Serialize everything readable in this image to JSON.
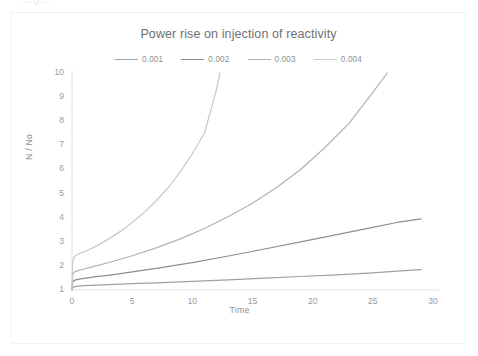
{
  "top_crop_text": "…g…",
  "chart_data": {
    "type": "line",
    "title": "Power rise on injection of reactivity",
    "xlabel": "Time",
    "ylabel": "N / No",
    "xlim": [
      0,
      30
    ],
    "ylim": [
      1,
      10
    ],
    "xticks": [
      0,
      5,
      10,
      15,
      20,
      25,
      30
    ],
    "yticks": [
      1,
      2,
      3,
      4,
      5,
      6,
      7,
      8,
      9,
      10
    ],
    "grid": false,
    "legend_position": "top-center",
    "series": [
      {
        "name": "0.001",
        "color": "#a0a1a3",
        "x": [
          0,
          0.05,
          0.12,
          0.25,
          0.5,
          1,
          2,
          3,
          5,
          7,
          10,
          13,
          16,
          19,
          22,
          25,
          27,
          29
        ],
        "y": [
          1.0,
          1.09,
          1.12,
          1.14,
          1.16,
          1.18,
          1.2,
          1.22,
          1.26,
          1.3,
          1.36,
          1.42,
          1.49,
          1.56,
          1.63,
          1.71,
          1.78,
          1.85
        ]
      },
      {
        "name": "0.002",
        "color": "#8d8e90",
        "x": [
          0,
          0.05,
          0.12,
          0.25,
          0.5,
          1,
          2,
          3,
          5,
          7,
          10,
          13,
          16,
          19,
          22,
          25,
          27,
          29
        ],
        "y": [
          1.0,
          1.3,
          1.37,
          1.41,
          1.44,
          1.48,
          1.55,
          1.61,
          1.75,
          1.9,
          2.14,
          2.41,
          2.7,
          3.0,
          3.3,
          3.6,
          3.8,
          3.95
        ]
      },
      {
        "name": "0.003",
        "color": "#b1b2b4",
        "x": [
          0,
          0.05,
          0.12,
          0.25,
          0.5,
          1,
          2,
          3,
          5,
          7,
          9,
          11,
          13,
          15,
          17,
          19,
          21,
          23,
          25,
          26.2
        ],
        "y": [
          1.0,
          1.62,
          1.7,
          1.76,
          1.8,
          1.87,
          2.0,
          2.13,
          2.42,
          2.75,
          3.12,
          3.55,
          4.05,
          4.6,
          5.25,
          6.0,
          6.9,
          7.9,
          9.2,
          10.0
        ]
      },
      {
        "name": "0.004",
        "color": "#c9cacc",
        "x": [
          0,
          0.05,
          0.12,
          0.25,
          0.5,
          0.8,
          1.2,
          2,
          3,
          4,
          5,
          6,
          7,
          8,
          9,
          10,
          11,
          12,
          12.3
        ],
        "y": [
          1.0,
          2.12,
          2.3,
          2.4,
          2.48,
          2.55,
          2.62,
          2.82,
          3.1,
          3.42,
          3.8,
          4.22,
          4.7,
          5.25,
          5.9,
          6.65,
          7.5,
          9.3,
          10.0
        ]
      }
    ]
  }
}
